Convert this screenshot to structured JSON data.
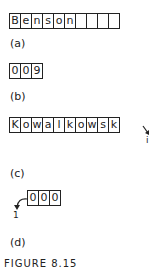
{
  "figure": {
    "caption": "FIGURE 8.15",
    "parts": [
      {
        "label": "(a)",
        "cells": [
          "B",
          "e",
          "n",
          "s",
          "o",
          "n",
          "",
          "",
          "",
          ""
        ]
      },
      {
        "label": "(b)",
        "cells": [
          "0",
          "0",
          "9"
        ]
      },
      {
        "label": "(c)",
        "cells": [
          "K",
          "o",
          "w",
          "a",
          "l",
          "k",
          "o",
          "w",
          "s",
          "k"
        ],
        "pointer": "i"
      },
      {
        "label": "(d)",
        "cells": [
          "0",
          "0",
          "0"
        ],
        "pointer": "1"
      }
    ]
  }
}
